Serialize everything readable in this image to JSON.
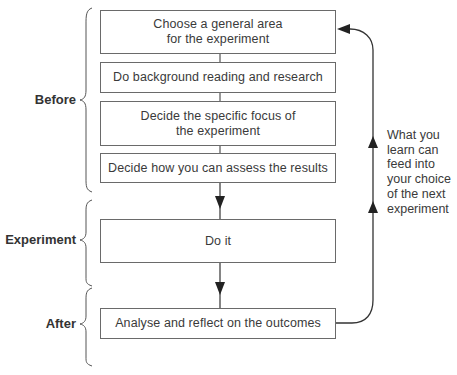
{
  "diagram": {
    "phases": [
      {
        "label": "Before"
      },
      {
        "label": "Experiment"
      },
      {
        "label": "After"
      }
    ],
    "steps": [
      {
        "label": "Choose a general area\nfor the experiment"
      },
      {
        "label": "Do background reading and research"
      },
      {
        "label": "Decide the specific focus of\nthe experiment"
      },
      {
        "label": "Decide how you can assess the results"
      },
      {
        "label": "Do it"
      },
      {
        "label": "Analyse and reflect on the outcomes"
      }
    ],
    "feedback_note": "What you\nlearn can\nfeed into\nyour choice\nof the next\nexperiment",
    "colors": {
      "line": "#333333",
      "box_border": "#6a6a6a",
      "text": "#3a3a3a"
    }
  }
}
